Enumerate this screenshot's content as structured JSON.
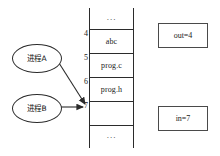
{
  "diagram": {
    "colors": {
      "stroke": "#2b2b2b",
      "box_stroke": "#4a4a4a",
      "background": "#ffffff",
      "text": "#1a1a1a"
    }
  },
  "buffer": {
    "name": "buffer-table",
    "rows": [
      {
        "index": "",
        "value": "..."
      },
      {
        "index": "4",
        "value": "abc"
      },
      {
        "index": "5",
        "value": "prog.c"
      },
      {
        "index": "6",
        "value": "prog.h"
      },
      {
        "index": "7",
        "value": ""
      },
      {
        "index": "",
        "value": "..."
      }
    ],
    "top_ellipsis": "...",
    "bottom_ellipsis": "..."
  },
  "indices": {
    "four": "4",
    "five": "5",
    "six": "6",
    "seven": "7"
  },
  "processes": [
    {
      "id": "process-a",
      "label": "进程A"
    },
    {
      "id": "process-b",
      "label": "进程B"
    }
  ],
  "pointers": {
    "out": {
      "label": "out=4",
      "value": "4"
    },
    "in": {
      "label": "in=7",
      "value": "7"
    }
  },
  "arrows": [
    {
      "name": "arrow-process-a-to-slot-7",
      "from": "process-a",
      "to": "slot-7",
      "style": "diagonal"
    },
    {
      "name": "arrow-process-b-to-slot-7",
      "from": "process-b",
      "to": "slot-7",
      "style": "horizontal"
    }
  ]
}
